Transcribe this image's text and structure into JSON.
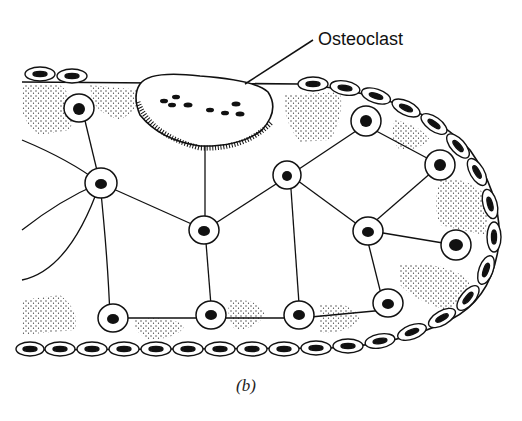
{
  "figure": {
    "caption": "(b)",
    "labels": {
      "osteoclast": "Osteoclast"
    },
    "colors": {
      "ink": "#111111",
      "background": "#ffffff",
      "stipple": "#333333"
    }
  }
}
